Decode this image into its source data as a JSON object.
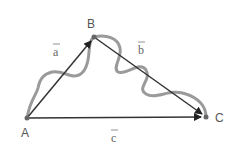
{
  "diagram": {
    "points": [
      {
        "id": "A",
        "label": "A",
        "x": 27,
        "y": 118
      },
      {
        "id": "B",
        "label": "B",
        "x": 94,
        "y": 37
      },
      {
        "id": "C",
        "label": "C",
        "x": 206,
        "y": 117
      }
    ],
    "vectors": [
      {
        "id": "a",
        "label": "a",
        "from": "A",
        "to": "B"
      },
      {
        "id": "b",
        "label": "b",
        "from": "B",
        "to": "C"
      },
      {
        "id": "c",
        "label": "c",
        "from": "A",
        "to": "C"
      }
    ],
    "colors": {
      "arrow": "#333333",
      "wavy_path": "#999999",
      "point": "#666666",
      "label": "#555555"
    }
  }
}
